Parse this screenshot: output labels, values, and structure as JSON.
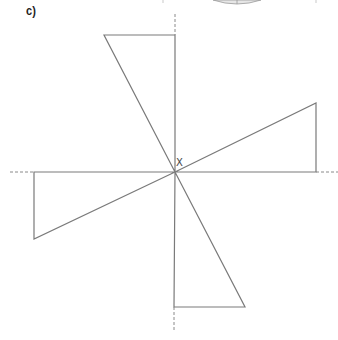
{
  "figure": {
    "part_label": "c)",
    "center_label": "X",
    "center": [
      175,
      172
    ],
    "colors": {
      "line": "#7a7a7a",
      "dash": "#8a8a8a",
      "text": "#222222",
      "arc_fill": "#e6e6e6"
    },
    "triangles": [
      {
        "name": "top",
        "points": [
          [
            175,
            172
          ],
          [
            104,
            35
          ],
          [
            175,
            35
          ]
        ]
      },
      {
        "name": "right",
        "points": [
          [
            175,
            172
          ],
          [
            316,
            103
          ],
          [
            316,
            172
          ]
        ]
      },
      {
        "name": "bottom",
        "points": [
          [
            175,
            172
          ],
          [
            245,
            307
          ],
          [
            174,
            307
          ]
        ]
      },
      {
        "name": "left",
        "points": [
          [
            175,
            172
          ],
          [
            34,
            239
          ],
          [
            34,
            172
          ]
        ]
      }
    ],
    "dashed_axes": [
      {
        "name": "top-axis",
        "from": [
          175,
          14
        ],
        "to": [
          175,
          35
        ]
      },
      {
        "name": "right-axis",
        "from": [
          316,
          172
        ],
        "to": [
          338,
          172
        ]
      },
      {
        "name": "bottom-axis",
        "from": [
          174,
          307
        ],
        "to": [
          174,
          332
        ]
      },
      {
        "name": "left-axis",
        "from": [
          10,
          172
        ],
        "to": [
          34,
          172
        ]
      }
    ]
  }
}
